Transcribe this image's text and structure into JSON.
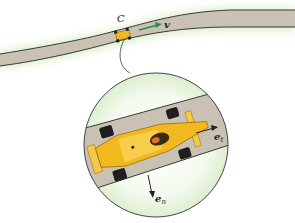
{
  "diagram": {
    "labels": {
      "point": "C",
      "velocity": "v",
      "tangent_vector": "e",
      "tangent_sub": "t",
      "normal_vector": "e",
      "normal_sub": "n"
    },
    "colors": {
      "road": "#c8c1b4",
      "road_edge": "#3a3a3a",
      "grass": "#d9efc8",
      "velocity_arrow": "#2e8b57",
      "car_body": "#f2b81f",
      "car_dark": "#c98a10",
      "tire": "#1e1e1e",
      "circle_outline": "#333333"
    }
  }
}
